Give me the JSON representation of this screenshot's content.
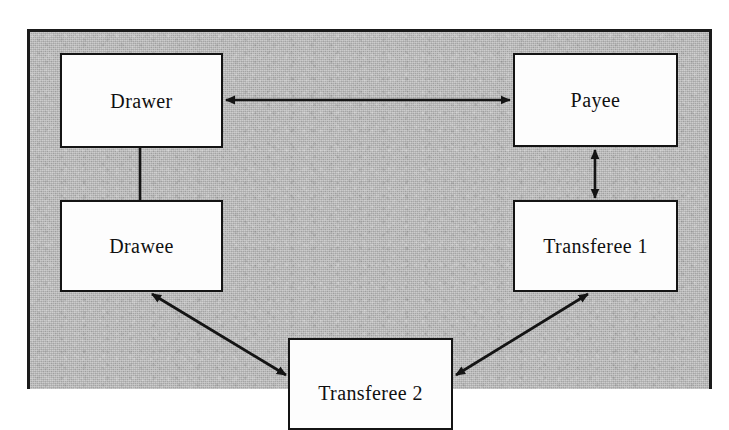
{
  "diagram": {
    "background_color": "#b9b9b9",
    "line_color": "#141414",
    "node_fill": "#fdfdfd",
    "nodes": [
      {
        "id": "drawer",
        "label": "Drawer",
        "x": 60,
        "y": 53,
        "w": 163,
        "h": 95
      },
      {
        "id": "payee",
        "label": "Payee",
        "x": 513,
        "y": 53,
        "w": 165,
        "h": 94
      },
      {
        "id": "drawee",
        "label": "Drawee",
        "x": 60,
        "y": 200,
        "w": 163,
        "h": 92
      },
      {
        "id": "transferee1",
        "label": "Transferee 1",
        "x": 513,
        "y": 200,
        "w": 165,
        "h": 92
      },
      {
        "id": "transferee2",
        "label": "Transferee 2",
        "x": 288,
        "y": 338,
        "w": 165,
        "h": 92
      }
    ],
    "edges": [
      {
        "id": "drawer-payee",
        "from": "drawer",
        "to": "payee",
        "style": "double-arrow",
        "orientation": "horizontal"
      },
      {
        "id": "drawer-drawee",
        "from": "drawer",
        "to": "drawee",
        "style": "plain-line",
        "orientation": "vertical"
      },
      {
        "id": "payee-transferee1",
        "from": "payee",
        "to": "transferee1",
        "style": "double-arrow",
        "orientation": "vertical"
      },
      {
        "id": "drawee-transferee2",
        "from": "drawee",
        "to": "transferee2",
        "style": "double-arrow",
        "orientation": "diagonal"
      },
      {
        "id": "transferee2-transferee1",
        "from": "transferee2",
        "to": "transferee1",
        "style": "double-arrow",
        "orientation": "diagonal"
      }
    ]
  }
}
